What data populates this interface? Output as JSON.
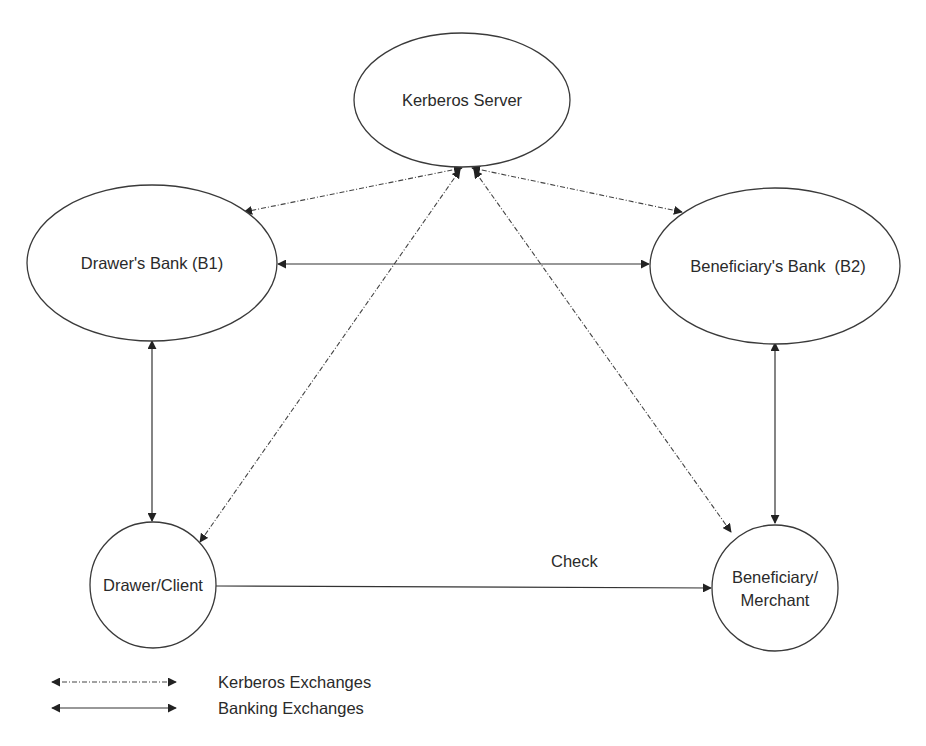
{
  "diagram": {
    "nodes": {
      "kerberos_server": {
        "label": "Kerberos Server"
      },
      "drawers_bank": {
        "label": "Drawer's Bank (B1)"
      },
      "beneficiarys_bank": {
        "label": "Beneficiary's Bank  (B2)"
      },
      "drawer_client": {
        "label": "Drawer/Client"
      },
      "beneficiary_merchant": {
        "line1": "Beneficiary/",
        "line2": "Merchant"
      }
    },
    "edges": [
      {
        "from": "Kerberos Server",
        "to": "Drawer's Bank (B1)",
        "type": "Kerberos Exchanges"
      },
      {
        "from": "Kerberos Server",
        "to": "Beneficiary's Bank (B2)",
        "type": "Kerberos Exchanges"
      },
      {
        "from": "Kerberos Server",
        "to": "Drawer/Client",
        "type": "Kerberos Exchanges"
      },
      {
        "from": "Kerberos Server",
        "to": "Beneficiary/Merchant",
        "type": "Kerberos Exchanges"
      },
      {
        "from": "Drawer's Bank (B1)",
        "to": "Beneficiary's Bank (B2)",
        "type": "Banking Exchanges"
      },
      {
        "from": "Drawer's Bank (B1)",
        "to": "Drawer/Client",
        "type": "Banking Exchanges"
      },
      {
        "from": "Beneficiary's Bank (B2)",
        "to": "Beneficiary/Merchant",
        "type": "Banking Exchanges"
      },
      {
        "from": "Drawer/Client",
        "to": "Beneficiary/Merchant",
        "type": "one-way",
        "label": "Check"
      }
    ],
    "check_label": "Check",
    "legend": {
      "kerberos": "Kerberos Exchanges",
      "banking": "Banking Exchanges"
    }
  }
}
